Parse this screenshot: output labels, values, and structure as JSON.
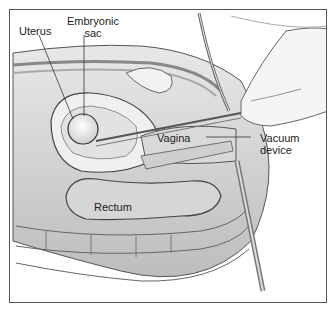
{
  "caption_partial": "...(clipped)...",
  "figure": {
    "type": "medical-illustration",
    "labels": {
      "uterus": "Uterus",
      "embryonic_sac_line1": "Embryonic",
      "embryonic_sac_line2": "sac",
      "vagina": "Vagina",
      "vacuum_line1": "Vacuum",
      "vacuum_line2": "device",
      "rectum": "Rectum"
    }
  }
}
